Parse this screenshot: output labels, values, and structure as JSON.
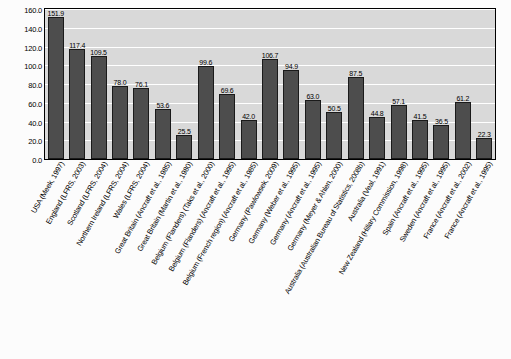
{
  "chart_data": {
    "type": "bar",
    "title": "",
    "xlabel": "",
    "ylabel": "",
    "ylim": [
      0,
      160
    ],
    "yticks": [
      "0.0",
      "20.0",
      "40.0",
      "60.0",
      "80.0",
      "100.0",
      "120.0",
      "140.0",
      "160.0"
    ],
    "grid": true,
    "legend": "none",
    "categories": [
      "USA (Meek, 1997)",
      "England (LFRS, 2003)",
      "Scotland (LFRS, 2004)",
      "Northern Ireland (LFRS, 2004)",
      "Wales (LFRS, 2004)",
      "Great Britain (Ancraft et al., 1985)",
      "Great Britain (Martin et al., 1980)",
      "Belgium (Flanders) (Taks et al., 2000)",
      "Belgium (Flanders) (Ancraft et al., 1995)",
      "Belgium (French region) (Ancraft et al., 1985)",
      "Germany (Pawlowsek, 2009)",
      "Germany (Weber et al., 1995)",
      "Germany (Ancraft et al., 1995)",
      "Germany (Meyer & Ahlen, 2000)",
      "Australia (Australian Bureau of Statistics, 2008b)",
      "Australia (Veal, 1991)",
      "New Zealand (Hillary Commission, 1998)",
      "Spain (Ancraft et al., 1995)",
      "Sweden (Ancraft et al., 1995)",
      "France (Ancraft et al., 2002)",
      "France (Ancraft et al., 1995)"
    ],
    "values": [
      151.9,
      117.4,
      109.5,
      78.0,
      76.1,
      53.6,
      25.5,
      99.6,
      69.6,
      42.0,
      106.7,
      94.9,
      63.0,
      50.5,
      87.5,
      44.8,
      57.1,
      41.5,
      36.5,
      61.2,
      22.3
    ],
    "value_labels": [
      "151.9",
      "117.4",
      "109.5",
      "78.0",
      "76.1",
      "53.6",
      "25.5",
      "99.6",
      "69.6",
      "42.0",
      "106.7",
      "94.9",
      "63.0",
      "50.5",
      "87.5",
      "44.8",
      "57.1",
      "41.5",
      "36.5",
      "61.2",
      "22.3"
    ],
    "colors": {
      "bar_fill": "#4d4d4d",
      "bar_border": "#1a1a1a",
      "plot_background": "#d9d9d9",
      "gridline": "#ffffff",
      "text": "#000000"
    }
  }
}
